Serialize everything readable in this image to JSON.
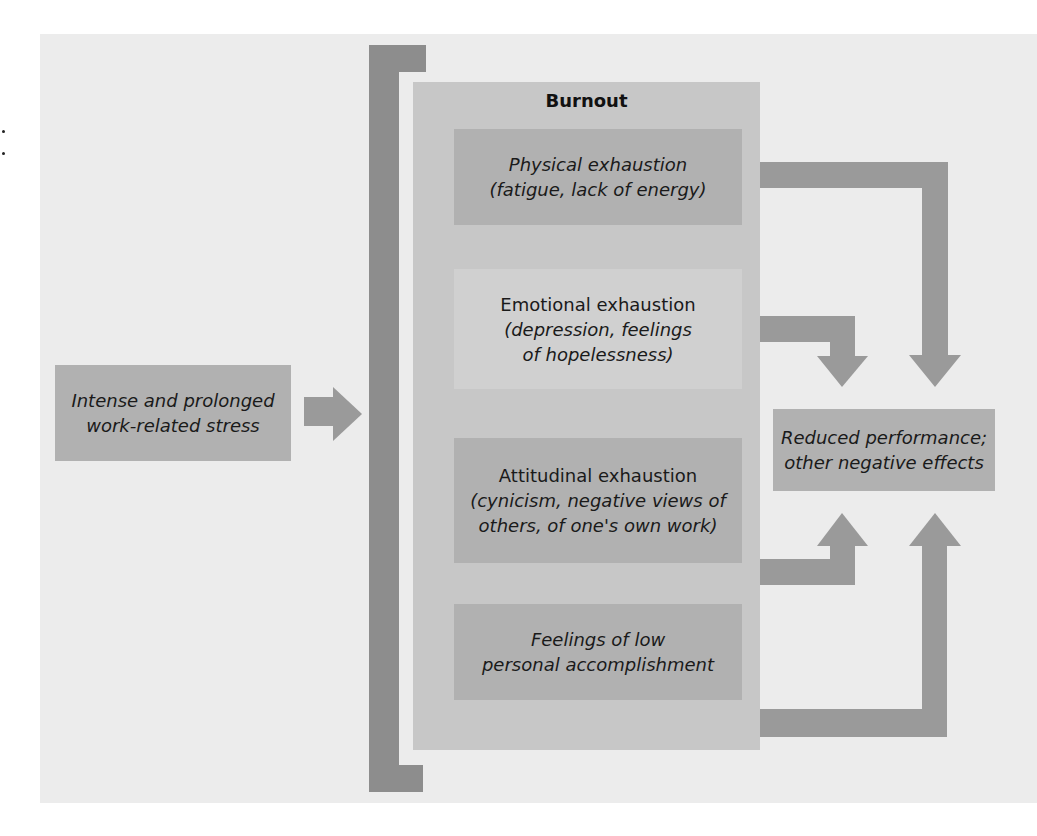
{
  "diagram": {
    "input": {
      "lines": [
        "Intense and prolonged",
        "work-related stress"
      ]
    },
    "burnout": {
      "title": "Burnout",
      "components": [
        {
          "id": "physical",
          "lines": [
            "Physical exhaustion",
            "(fatigue, lack of energy)"
          ],
          "style": "dark",
          "italic": [
            true,
            true
          ]
        },
        {
          "id": "emotional",
          "lines": [
            "Emotional exhaustion",
            "(depression, feelings",
            "of hopelessness)"
          ],
          "style": "light",
          "italic": [
            false,
            true,
            true
          ]
        },
        {
          "id": "attitudinal",
          "lines": [
            "Attitudinal exhaustion",
            "(cynicism, negative views of",
            "others, of one's own work)"
          ],
          "style": "dark",
          "italic": [
            false,
            true,
            true
          ]
        },
        {
          "id": "accomplishment",
          "lines": [
            "Feelings of low",
            "personal accomplishment"
          ],
          "style": "dark",
          "italic": [
            true,
            true
          ]
        }
      ]
    },
    "output": {
      "lines": [
        "Reduced performance;",
        "other negative effects"
      ]
    },
    "colors": {
      "panel": "#ececec",
      "container": "#c7c7c7",
      "box_dark": "#b1b1b1",
      "box_light": "#d0d0d0",
      "arrow": "#9a9a9a",
      "bracket": "#8d8d8d"
    }
  }
}
